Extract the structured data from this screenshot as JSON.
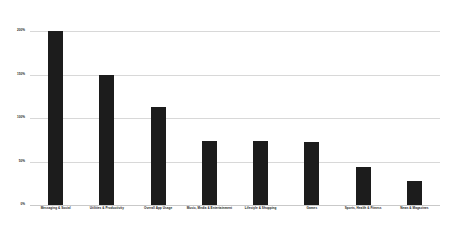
{
  "chart_data": {
    "type": "bar",
    "title": "",
    "subtitle": "",
    "xlabel": "",
    "ylabel": "",
    "ylim": [
      0,
      200
    ],
    "grid": true,
    "legend": false,
    "legend_position": "none",
    "bar_color": "#1c1c1c",
    "gridline_color": "#d8d8d8",
    "background_color": "#ffffff",
    "categories": [
      "Messaging & Social",
      "Utilities & Productivity",
      "Overall App Usage",
      "Music, Media & Entertainment",
      "Lifestyle & Shopping",
      "Games",
      "Sports, Health & Fitness",
      "News & Magazines"
    ],
    "values": [
      200,
      150,
      113,
      74,
      74,
      73,
      44,
      28
    ],
    "ytick_labels": [
      "200%",
      "150%",
      "100%",
      "50%",
      "0%"
    ],
    "ytick_values": [
      200,
      150,
      100,
      50,
      0
    ]
  }
}
